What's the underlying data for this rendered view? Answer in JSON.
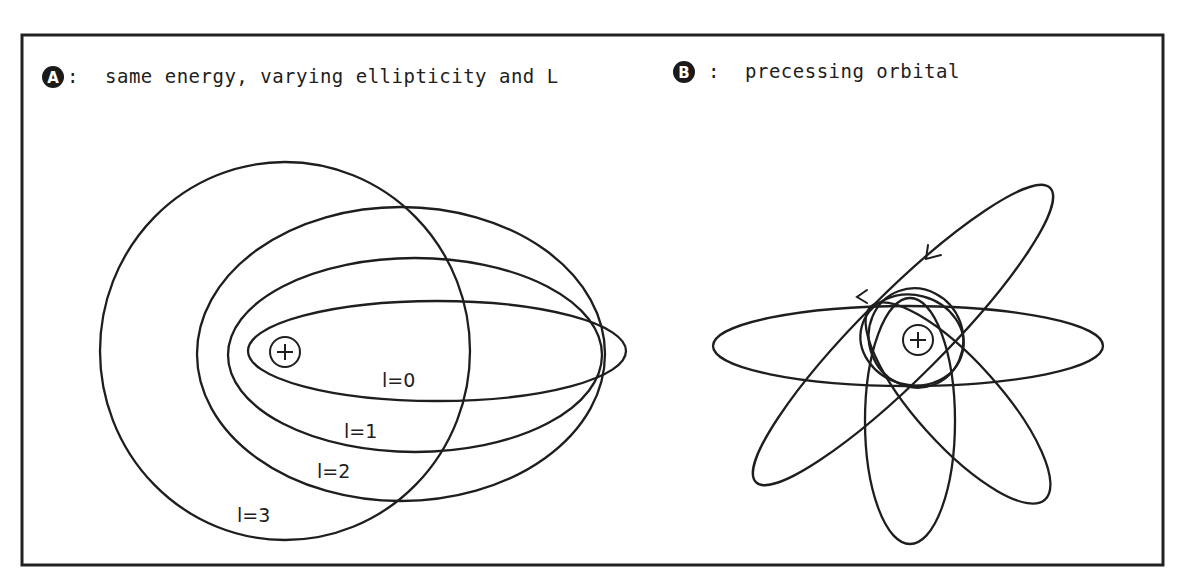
{
  "panel_a": {
    "badge": "A",
    "separator": ":",
    "caption": "same energy, varying ellipticity and L",
    "nucleus_symbol": "+",
    "orbits": [
      {
        "label": "l=0"
      },
      {
        "label": "l=1"
      },
      {
        "label": "l=2"
      },
      {
        "label": "l=3"
      }
    ]
  },
  "panel_b": {
    "badge": "B",
    "separator": ":",
    "caption": "precessing orbital",
    "nucleus_symbol": "+",
    "orbit_count": 4,
    "direction": "counter-clockwise"
  },
  "colors": {
    "ink": "#1e1e1e",
    "background": "#ffffff"
  }
}
